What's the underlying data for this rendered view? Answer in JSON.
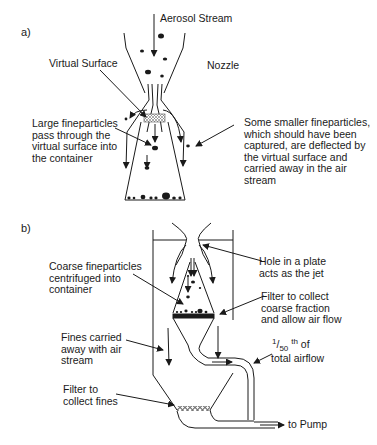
{
  "figure": {
    "panel_a": {
      "label": "a)",
      "labels": {
        "aerosol_stream": "Aerosol Stream",
        "nozzle": "Nozzle",
        "virtual_surface": "Virtual Surface",
        "large_fineparticles": "Large fineparticles\npass through the\nvirtual surface into\nthe container",
        "smaller_fineparticles": "Some smaller fineparticles,\nwhich should have been\ncaptured, are deflected by\nthe virtual surface and\ncarried away in the air\nstream"
      }
    },
    "panel_b": {
      "label": "b)",
      "labels": {
        "hole_in_plate": "Hole in a plate\nacts as the jet",
        "coarse_fineparticles": "Coarse fineparticles\ncentrifuged into\ncontainer",
        "filter_coarse": "Filter to collect\ncoarse fraction\nand allow air flow",
        "fines_carried": "Fines carried\naway with air\nstream",
        "airflow_fraction_num": "1",
        "airflow_fraction_den": "50",
        "airflow_fraction_suffix": "th",
        "airflow_fraction_rest": " of",
        "airflow_total": "total airflow",
        "filter_fines": "Filter to\ncollect fines",
        "to_pump": "to Pump"
      }
    },
    "colors": {
      "line": "#1a1a1a",
      "background": "#ffffff"
    }
  }
}
